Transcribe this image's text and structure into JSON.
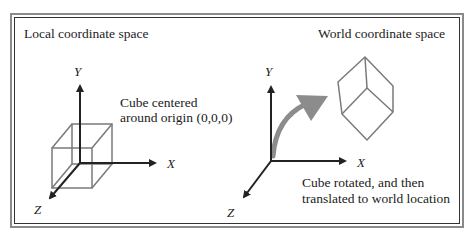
{
  "panels": {
    "local": {
      "title": "Local coordinate space",
      "caption_line1": "Cube centered",
      "caption_line2": "around origin (0,0,0)",
      "axes": {
        "x": "X",
        "y": "Y",
        "z": "Z"
      }
    },
    "world": {
      "title": "World coordinate space",
      "caption_line1": "Cube rotated, and then",
      "caption_line2": "translated to world location",
      "axes": {
        "x": "X",
        "y": "Y",
        "z": "Z"
      }
    }
  },
  "colors": {
    "axis": "#222222",
    "cube": "#7a7a7a",
    "transform_arrow": "#8c8c8c",
    "frame_outer": "#8a8a8a",
    "frame_inner": "#333333"
  }
}
